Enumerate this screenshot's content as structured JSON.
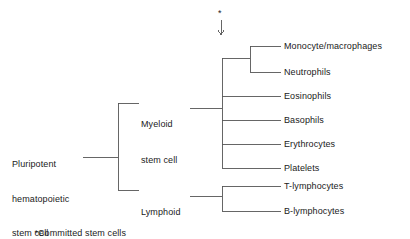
{
  "diagram": {
    "type": "tree",
    "orientation": "left-to-right",
    "line_color": "#555555",
    "text_color": "#1a1a1a",
    "background_color": "#ffffff",
    "root": {
      "id": "pluripotent",
      "label_lines": [
        "Pluripotent",
        "hematopoietic",
        "stem cell"
      ],
      "label": "Pluripotent hematopoietic stem cell"
    },
    "level2": [
      {
        "id": "myeloid",
        "label_lines": [
          "Myeloid",
          "stem cell"
        ],
        "label": "Myeloid stem cell"
      },
      {
        "id": "lymphoid",
        "label_lines": [
          "Lymphoid",
          "stem cell"
        ],
        "label": "Lymphoid stem cell"
      }
    ],
    "leaves_myeloid": [
      {
        "id": "monocyte-macrophages",
        "label": "Monocyte/macrophages"
      },
      {
        "id": "neutrophils",
        "label": "Neutrophils"
      },
      {
        "id": "eosinophils",
        "label": "Eosinophils"
      },
      {
        "id": "basophils",
        "label": "Basophils"
      },
      {
        "id": "erythrocytes",
        "label": "Erythrocytes"
      },
      {
        "id": "platelets",
        "label": "Platelets"
      }
    ],
    "leaves_lymphoid": [
      {
        "id": "t-lymphocytes",
        "label": "T-lymphocytes"
      },
      {
        "id": "b-lymphocytes",
        "label": "B-lymphocytes"
      }
    ],
    "marker": {
      "asterisk": "*",
      "arrow": "down-arrow"
    },
    "footnote": {
      "asterisk": "*",
      "text": "Committed stem cells"
    }
  }
}
